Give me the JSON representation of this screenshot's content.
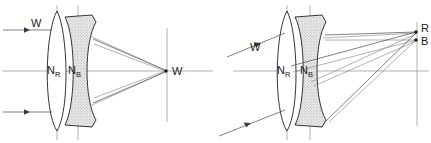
{
  "figure": {
    "type": "optical-ray-diagram",
    "background_color": "#ffffff",
    "ink_color": "#2a2a2a",
    "ray_color": "#4a4a4a",
    "axis_color": "#8a8a8a",
    "shaded_lens_fill": "#e2e2e2"
  },
  "panels": [
    {
      "id": "axial",
      "name": "axial-rays-panel",
      "incoming_ray_label": "W",
      "focus_label": "W",
      "lens_labels": [
        {
          "base": "N",
          "sub": "R"
        },
        {
          "base": "N",
          "sub": "B"
        }
      ],
      "incoming_ray_count": 2,
      "focus_count": 1
    },
    {
      "id": "oblique",
      "name": "oblique-rays-panel",
      "incoming_ray_label": "W",
      "focus_labels": [
        "R",
        "B"
      ],
      "lens_labels": [
        {
          "base": "N",
          "sub": "R"
        },
        {
          "base": "N",
          "sub": "B"
        }
      ],
      "incoming_ray_count": 2,
      "focus_count": 2
    }
  ],
  "legend": {
    "W": "White light",
    "R": "Red focus",
    "B": "Blue focus",
    "N_R": "Refractive index for red",
    "N_B": "Refractive index for blue"
  }
}
